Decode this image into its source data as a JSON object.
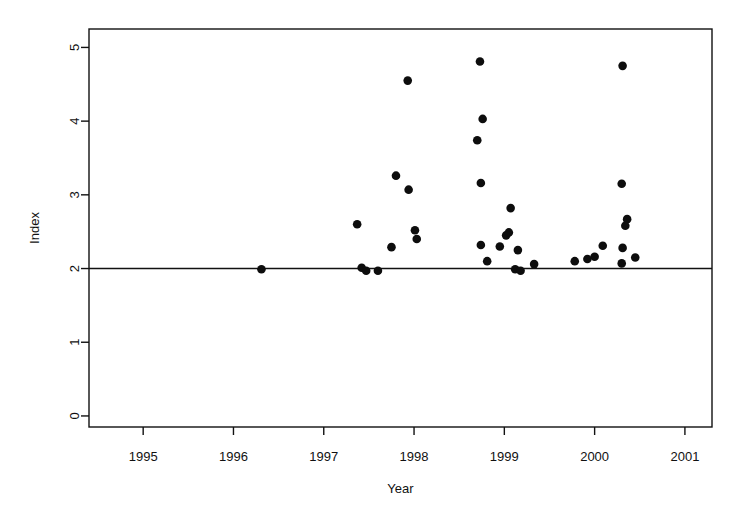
{
  "chart_data": {
    "type": "scatter",
    "title": "",
    "xlabel": "Year",
    "ylabel": "Index",
    "xlim": [
      1994.4,
      2001.3
    ],
    "ylim": [
      -0.15,
      5.25
    ],
    "grid": false,
    "legend": "none",
    "x_ticks": [
      1995,
      1996,
      1997,
      1998,
      1999,
      2000,
      2001
    ],
    "x_tick_labels": [
      "1995",
      "1996",
      "1997",
      "1998",
      "1999",
      "2000",
      "2001"
    ],
    "y_ticks": [
      0,
      1,
      2,
      3,
      4,
      5
    ],
    "y_tick_labels": [
      "0",
      "1",
      "2",
      "3",
      "4",
      "5"
    ],
    "reference_line": {
      "orientation": "horizontal",
      "y": 2.0,
      "label": ""
    },
    "points": [
      {
        "x": 1996.31,
        "y": 1.99
      },
      {
        "x": 1997.37,
        "y": 2.6
      },
      {
        "x": 1997.42,
        "y": 2.01
      },
      {
        "x": 1997.47,
        "y": 1.97
      },
      {
        "x": 1997.6,
        "y": 1.97
      },
      {
        "x": 1997.8,
        "y": 3.26
      },
      {
        "x": 1997.75,
        "y": 2.29
      },
      {
        "x": 1997.93,
        "y": 4.55
      },
      {
        "x": 1997.94,
        "y": 3.07
      },
      {
        "x": 1998.01,
        "y": 2.52
      },
      {
        "x": 1998.03,
        "y": 2.4
      },
      {
        "x": 1998.73,
        "y": 4.81
      },
      {
        "x": 1998.76,
        "y": 4.03
      },
      {
        "x": 1998.7,
        "y": 3.74
      },
      {
        "x": 1998.74,
        "y": 3.16
      },
      {
        "x": 1998.74,
        "y": 2.32
      },
      {
        "x": 1998.81,
        "y": 2.1
      },
      {
        "x": 1998.95,
        "y": 2.3
      },
      {
        "x": 1999.07,
        "y": 2.82
      },
      {
        "x": 1999.02,
        "y": 2.45
      },
      {
        "x": 1999.05,
        "y": 2.49
      },
      {
        "x": 1999.15,
        "y": 2.25
      },
      {
        "x": 1999.12,
        "y": 1.99
      },
      {
        "x": 1999.18,
        "y": 1.97
      },
      {
        "x": 1999.33,
        "y": 2.06
      },
      {
        "x": 1999.78,
        "y": 2.1
      },
      {
        "x": 1999.92,
        "y": 2.13
      },
      {
        "x": 2000.0,
        "y": 2.16
      },
      {
        "x": 2000.09,
        "y": 2.31
      },
      {
        "x": 2000.31,
        "y": 4.75
      },
      {
        "x": 2000.3,
        "y": 3.15
      },
      {
        "x": 2000.36,
        "y": 2.67
      },
      {
        "x": 2000.34,
        "y": 2.58
      },
      {
        "x": 2000.31,
        "y": 2.28
      },
      {
        "x": 2000.3,
        "y": 2.07
      },
      {
        "x": 2000.45,
        "y": 2.15
      }
    ]
  }
}
